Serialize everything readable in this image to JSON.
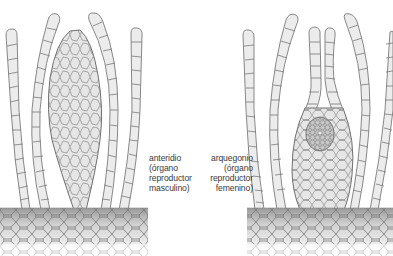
{
  "figure": {
    "top_caption_clipped": "",
    "panels": [
      {
        "id": "antheridium",
        "label_lines": [
          "anteridio",
          "(órgano",
          "reproductor",
          "masculino)"
        ]
      },
      {
        "id": "archegonium",
        "label_lines": [
          "arquegonio",
          "(órgano",
          "reproductor",
          "femenino)"
        ]
      }
    ]
  },
  "colors": {
    "cell_fill": "#ececec",
    "cell_stroke": "#777777",
    "organ_fill": "#e4e4e4",
    "egg_fill": "#c9c9c9",
    "ground_top": "#9e9e9e",
    "ground_bottom": "#ffffff",
    "label_text": "#3a3a3a"
  }
}
